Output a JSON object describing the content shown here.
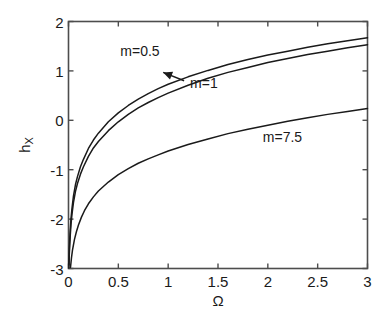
{
  "chart_data": {
    "type": "line",
    "title": "",
    "subtitle": "",
    "xlabel": "Ω",
    "ylabel": "h_X",
    "ylabel_base": "h",
    "ylabel_sub": "X",
    "xlim": [
      0,
      3
    ],
    "ylim": [
      -3,
      2
    ],
    "xticks": [
      0,
      0.5,
      1,
      1.5,
      2,
      2.5,
      3
    ],
    "xtick_labels": [
      "0",
      "0.5",
      "1",
      "1.5",
      "2",
      "2.5",
      "3"
    ],
    "yticks": [
      -3,
      -2,
      -1,
      0,
      1,
      2
    ],
    "ytick_labels": [
      "-3",
      "-2",
      "-1",
      "0",
      "1",
      "2"
    ],
    "grid": false,
    "legend_position": "inline-annotations",
    "line_color": "#1a1a1a",
    "background_color": "#ffffff",
    "axis_color": "#4d4d4d",
    "annotations": [
      {
        "name": "m-0.5-label",
        "text": "m=0.5",
        "x": 0.52,
        "y": 1.37
      },
      {
        "name": "m-1-label",
        "text": "m=1",
        "x": 1.22,
        "y": 0.72,
        "arrow_to": {
          "x": 0.95,
          "y": 0.97
        }
      },
      {
        "name": "m-7.5-label",
        "text": "m=7.5",
        "x": 1.95,
        "y": -0.38
      }
    ],
    "series": [
      {
        "name": "m=0.5",
        "label": "m=0.5",
        "x": [
          0.004,
          0.008,
          0.012,
          0.018,
          0.025,
          0.035,
          0.05,
          0.07,
          0.09,
          0.12,
          0.15,
          0.2,
          0.25,
          0.3,
          0.4,
          0.5,
          0.6,
          0.7,
          0.8,
          0.9,
          1.0,
          1.2,
          1.4,
          1.6,
          1.8,
          2.0,
          2.2,
          2.4,
          2.6,
          2.8,
          3.0
        ],
        "values": [
          -2.93,
          -2.62,
          -2.42,
          -2.2,
          -1.99,
          -1.78,
          -1.53,
          -1.3,
          -1.14,
          -0.94,
          -0.79,
          -0.57,
          -0.4,
          -0.26,
          -0.03,
          0.15,
          0.3,
          0.43,
          0.54,
          0.64,
          0.73,
          0.88,
          1.01,
          1.13,
          1.23,
          1.32,
          1.4,
          1.48,
          1.55,
          1.61,
          1.67
        ]
      },
      {
        "name": "m=1",
        "label": "m=1",
        "x": [
          0.004,
          0.008,
          0.012,
          0.018,
          0.025,
          0.035,
          0.05,
          0.07,
          0.09,
          0.12,
          0.15,
          0.2,
          0.25,
          0.3,
          0.4,
          0.5,
          0.6,
          0.7,
          0.8,
          0.9,
          1.0,
          1.2,
          1.4,
          1.6,
          1.8,
          2.0,
          2.2,
          2.4,
          2.6,
          2.8,
          3.0
        ],
        "values": [
          -2.99,
          -2.72,
          -2.53,
          -2.32,
          -2.11,
          -1.9,
          -1.66,
          -1.44,
          -1.28,
          -1.09,
          -0.94,
          -0.73,
          -0.56,
          -0.43,
          -0.21,
          -0.03,
          0.12,
          0.25,
          0.36,
          0.46,
          0.55,
          0.71,
          0.85,
          0.97,
          1.07,
          1.17,
          1.25,
          1.33,
          1.4,
          1.47,
          1.53
        ]
      },
      {
        "name": "m=7.5",
        "label": "m=7.5",
        "x": [
          0.02,
          0.03,
          0.04,
          0.06,
          0.08,
          0.1,
          0.13,
          0.16,
          0.2,
          0.25,
          0.3,
          0.4,
          0.5,
          0.6,
          0.7,
          0.8,
          0.9,
          1.0,
          1.2,
          1.4,
          1.6,
          1.8,
          2.0,
          2.2,
          2.4,
          2.6,
          2.8,
          3.0
        ],
        "values": [
          -2.98,
          -2.78,
          -2.63,
          -2.41,
          -2.25,
          -2.12,
          -1.96,
          -1.83,
          -1.69,
          -1.55,
          -1.43,
          -1.25,
          -1.1,
          -0.98,
          -0.87,
          -0.78,
          -0.7,
          -0.62,
          -0.49,
          -0.38,
          -0.27,
          -0.18,
          -0.1,
          -0.02,
          0.05,
          0.12,
          0.18,
          0.24
        ]
      }
    ]
  }
}
